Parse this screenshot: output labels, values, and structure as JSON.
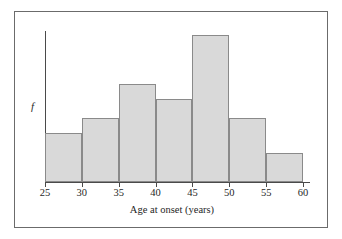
{
  "figure": {
    "kind": "histogram-figure",
    "frame_visible": true
  },
  "axes": {
    "y_label": "f",
    "x_title": "Age at onset (years)",
    "axis_break_glyph": "∕∕",
    "tick_labels": [
      "25",
      "30",
      "35",
      "40",
      "45",
      "50",
      "55",
      "60"
    ]
  },
  "colors": {
    "bar_fill": "#d9d9d9",
    "bar_border": "#8a8a8a",
    "axis": "#4a4a4a",
    "frame": "#6b6b6b",
    "text": "#1f1f1f",
    "background": "#ffffff"
  },
  "chart_data": {
    "type": "bar",
    "title": "",
    "subtitle": "",
    "xlabel": "Age at onset (years)",
    "ylabel": "f",
    "categories": [
      "25-30",
      "30-35",
      "35-40",
      "40-45",
      "45-50",
      "50-55",
      "55-60"
    ],
    "bin_edges": [
      25,
      30,
      35,
      40,
      45,
      50,
      55,
      60
    ],
    "values": [
      5,
      6.5,
      10,
      8.5,
      15,
      6.5,
      3
    ],
    "xlim": [
      25,
      60
    ],
    "ylim": [
      0,
      16
    ],
    "x_ticks": [
      25,
      30,
      35,
      40,
      45,
      50,
      55,
      60
    ],
    "x_tick_labels": [
      "25",
      "30",
      "35",
      "40",
      "45",
      "50",
      "55",
      "60"
    ],
    "y_ticks": [],
    "y_tick_labels": [],
    "grid": false,
    "legend": false,
    "legend_position": "none",
    "annotations": [
      {
        "name": "y-axis-break",
        "text": "∕∕",
        "note": "axis break marker near origin on horizontal axis"
      }
    ]
  }
}
